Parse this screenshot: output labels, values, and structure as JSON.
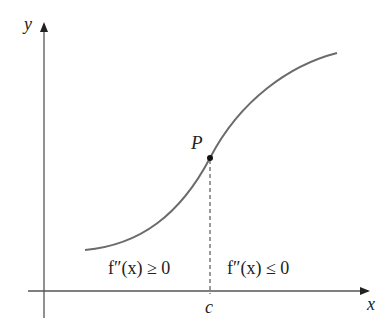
{
  "diagram": {
    "axes": {
      "x_label": "x",
      "y_label": "y"
    },
    "point": {
      "label": "P"
    },
    "tick": {
      "label": "c"
    },
    "regions": {
      "left": "f″(x) ≥ 0",
      "right": "f″(x) ≤ 0"
    },
    "colors": {
      "curve": "#6b6b6b",
      "axis": "#333333",
      "text": "#222222"
    }
  }
}
